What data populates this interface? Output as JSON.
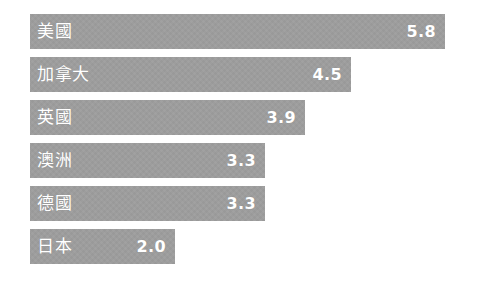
{
  "chart_data": {
    "type": "bar",
    "orientation": "horizontal",
    "title": "",
    "subtitle": "",
    "xlabel": "",
    "ylabel": "",
    "grid": false,
    "legend": null,
    "axis_visible": false,
    "xlim": [
      0,
      5.8
    ],
    "categories": [
      "美國",
      "加拿大",
      "英國",
      "澳洲",
      "德國",
      "日本"
    ],
    "values": [
      5.8,
      4.5,
      3.9,
      3.3,
      3.3,
      2.0
    ],
    "value_labels": [
      "5.8",
      "4.5",
      "3.9",
      "3.3",
      "3.3",
      "2.0"
    ],
    "bars": [
      {
        "category": "美國",
        "value": 5.8,
        "value_label": "5.8",
        "bar_width_px": 415
      },
      {
        "category": "加拿大",
        "value": 4.5,
        "value_label": "4.5",
        "bar_width_px": 321
      },
      {
        "category": "英國",
        "value": 3.9,
        "value_label": "3.9",
        "bar_width_px": 275
      },
      {
        "category": "澳洲",
        "value": 3.3,
        "value_label": "3.3",
        "bar_width_px": 235
      },
      {
        "category": "德國",
        "value": 3.3,
        "value_label": "3.3",
        "bar_width_px": 235
      },
      {
        "category": "日本",
        "value": 2.0,
        "value_label": "2.0",
        "bar_width_px": 145
      }
    ],
    "colors": {
      "bar_fill": "#9d9d9d",
      "label_text": "#ffffff",
      "value_text": "#ffffff",
      "background": "#ffffff"
    }
  }
}
